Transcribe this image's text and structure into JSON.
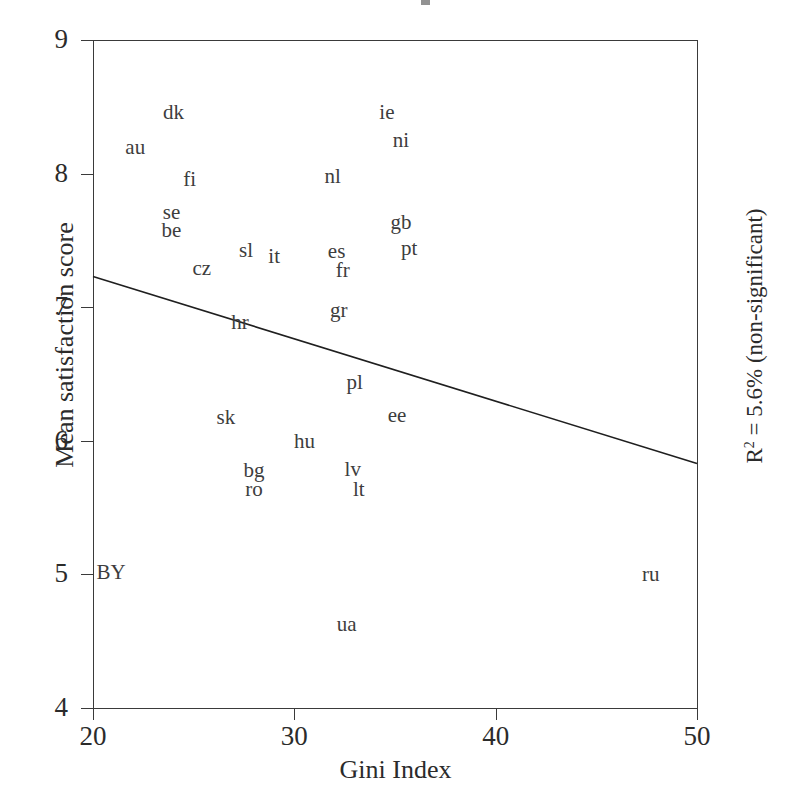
{
  "chart_data": {
    "type": "scatter",
    "title": "",
    "xlabel": "Gini Index",
    "ylabel": "Mean satisfaction score",
    "xlim": [
      20,
      50
    ],
    "ylim": [
      4,
      9
    ],
    "xticks": [
      20,
      30,
      40,
      50
    ],
    "yticks": [
      4,
      5,
      6,
      7,
      8,
      9
    ],
    "grid": false,
    "legend": null,
    "marker_style": "country-code-text-label",
    "annotation": {
      "r_squared_text": "R",
      "r_squared_exponent": "2",
      "r_squared_value": " = 5.6%",
      "significance": "(non-significant)",
      "position": "right-of-axis-rotated"
    },
    "trendline": {
      "type": "linear-fit",
      "x_start": 20,
      "y_start": 7.23,
      "x_end": 50,
      "y_end": 5.83,
      "slope": -0.0467,
      "intercept": 8.16
    },
    "points": [
      {
        "label": "dk",
        "x": 24.0,
        "y": 8.46
      },
      {
        "label": "ie",
        "x": 34.6,
        "y": 8.46
      },
      {
        "label": "ni",
        "x": 35.3,
        "y": 8.25
      },
      {
        "label": "au",
        "x": 22.1,
        "y": 8.2
      },
      {
        "label": "fi",
        "x": 24.8,
        "y": 7.96
      },
      {
        "label": "nl",
        "x": 31.9,
        "y": 7.98
      },
      {
        "label": "se",
        "x": 23.9,
        "y": 7.71
      },
      {
        "label": "gb",
        "x": 35.3,
        "y": 7.64
      },
      {
        "label": "be",
        "x": 23.9,
        "y": 7.58
      },
      {
        "label": "sl",
        "x": 27.6,
        "y": 7.43
      },
      {
        "label": "it",
        "x": 29.0,
        "y": 7.38
      },
      {
        "label": "es",
        "x": 32.1,
        "y": 7.42
      },
      {
        "label": "pt",
        "x": 35.7,
        "y": 7.44
      },
      {
        "label": "cz",
        "x": 25.4,
        "y": 7.29
      },
      {
        "label": "fr",
        "x": 32.4,
        "y": 7.28
      },
      {
        "label": "hr",
        "x": 27.3,
        "y": 6.89
      },
      {
        "label": "gr",
        "x": 32.2,
        "y": 6.98
      },
      {
        "label": "pl",
        "x": 33.0,
        "y": 6.44
      },
      {
        "label": "sk",
        "x": 26.6,
        "y": 6.18
      },
      {
        "label": "ee",
        "x": 35.1,
        "y": 6.19
      },
      {
        "label": "hu",
        "x": 30.5,
        "y": 6.0
      },
      {
        "label": "bg",
        "x": 28.0,
        "y": 5.78
      },
      {
        "label": "lv",
        "x": 32.9,
        "y": 5.79
      },
      {
        "label": "ro",
        "x": 28.0,
        "y": 5.64
      },
      {
        "label": "lt",
        "x": 33.2,
        "y": 5.64
      },
      {
        "label": "BY",
        "x": 20.9,
        "y": 5.02
      },
      {
        "label": "ru",
        "x": 47.7,
        "y": 5.0
      },
      {
        "label": "ua",
        "x": 32.6,
        "y": 4.63
      }
    ]
  },
  "axes": {
    "y_tick_labels": [
      "9",
      "8",
      "7",
      "6",
      "5",
      "4"
    ],
    "x_tick_labels": [
      "20",
      "30",
      "40",
      "50"
    ],
    "y_axis_title": "Mean satisfaction score",
    "x_axis_title": "Gini Index"
  },
  "colors": {
    "axis": "#3a3a3a",
    "text": "#2b2b2b",
    "label": "#3d3d3d",
    "trendline": "#1f1f1f",
    "background": "#ffffff"
  }
}
